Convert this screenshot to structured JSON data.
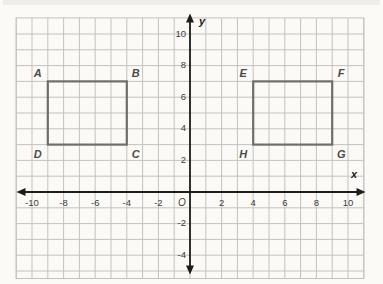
{
  "chart_data": {
    "type": "scatter",
    "title": "",
    "xlabel": "x",
    "ylabel": "y",
    "origin_label": "O",
    "xlim": [
      -11,
      11
    ],
    "ylim": [
      -5.5,
      11
    ],
    "grid": true,
    "grid_step": 1,
    "x_tick_labels": [
      -10,
      -8,
      -6,
      -4,
      -2,
      2,
      4,
      6,
      8,
      10
    ],
    "y_tick_labels": [
      10,
      8,
      6,
      4,
      2,
      -2,
      -4
    ],
    "shapes": [
      {
        "name": "ABCD",
        "shape": "rectangle",
        "vertices": [
          {
            "label": "A",
            "x": -9,
            "y": 7
          },
          {
            "label": "B",
            "x": -4,
            "y": 7
          },
          {
            "label": "C",
            "x": -4,
            "y": 3
          },
          {
            "label": "D",
            "x": -9,
            "y": 3
          }
        ]
      },
      {
        "name": "EFGH",
        "shape": "rectangle",
        "vertices": [
          {
            "label": "E",
            "x": 4,
            "y": 7
          },
          {
            "label": "F",
            "x": 9,
            "y": 7
          },
          {
            "label": "G",
            "x": 9,
            "y": 3
          },
          {
            "label": "H",
            "x": 4,
            "y": 3
          }
        ]
      }
    ],
    "legend": null,
    "colors": {
      "background": "#fbfaf7",
      "grid": "#c3c2bf",
      "axis": "#1d1d1b",
      "shape_stroke": "#6e6e6c",
      "tick_label": "#3c3c3a",
      "vertex_label": "#4a4a48"
    }
  }
}
